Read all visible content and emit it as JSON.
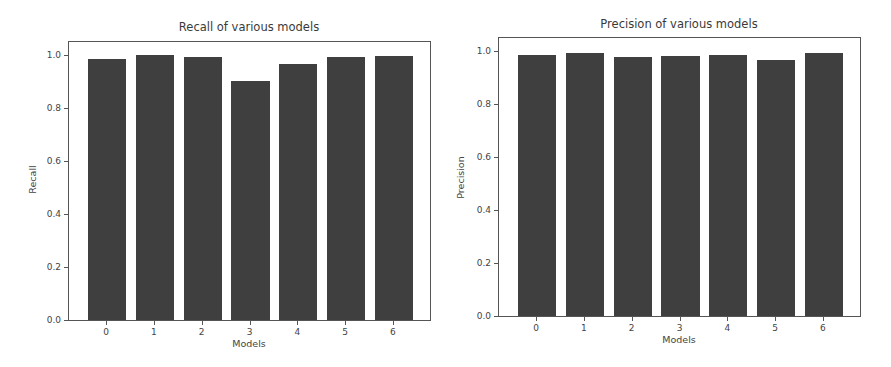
{
  "chart_data": [
    {
      "type": "bar",
      "title": "Recall of various models",
      "xlabel": "Models",
      "ylabel": "Recall",
      "categories": [
        "0",
        "1",
        "2",
        "3",
        "4",
        "5",
        "6"
      ],
      "values": [
        0.985,
        1.0,
        0.993,
        0.903,
        0.967,
        0.993,
        0.999
      ],
      "yticks": [
        "0.0",
        "0.2",
        "0.4",
        "0.6",
        "0.8",
        "1.0"
      ],
      "ylim": [
        0,
        1.05
      ],
      "grid": false,
      "bar_color": "#3f3f3f"
    },
    {
      "type": "bar",
      "title": "Precision of various models",
      "xlabel": "Models",
      "ylabel": "Precision",
      "categories": [
        "0",
        "1",
        "2",
        "3",
        "4",
        "5",
        "6"
      ],
      "values": [
        0.985,
        0.993,
        0.98,
        0.982,
        0.987,
        0.967,
        0.995
      ],
      "yticks": [
        "0.0",
        "0.2",
        "0.4",
        "0.6",
        "0.8",
        "1.0"
      ],
      "ylim": [
        0,
        1.05
      ],
      "grid": false,
      "bar_color": "#3f3f3f"
    }
  ]
}
